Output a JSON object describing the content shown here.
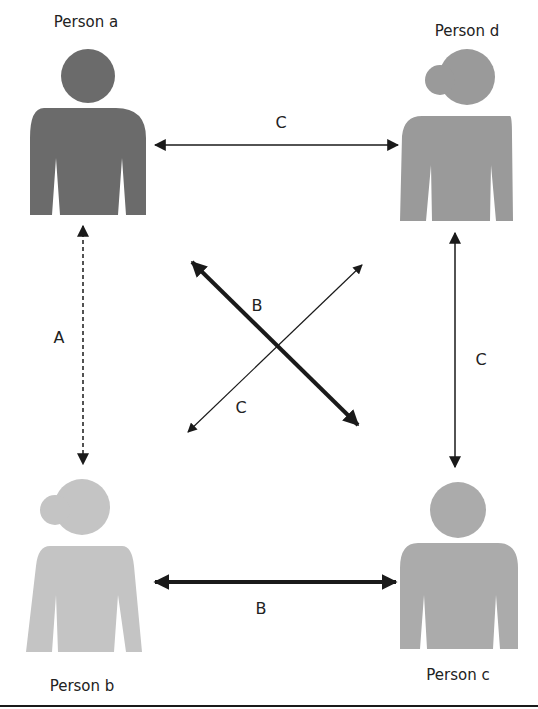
{
  "persons": [
    {
      "id": "a",
      "label": "Person a",
      "figure": "male",
      "color": "#6b6b6b"
    },
    {
      "id": "d",
      "label": "Person d",
      "figure": "female",
      "color": "#9a9a9a"
    },
    {
      "id": "b",
      "label": "Person b",
      "figure": "female",
      "color": "#c4c4c4"
    },
    {
      "id": "c",
      "label": "Person c",
      "figure": "male",
      "color": "#ababab"
    }
  ],
  "edges": [
    {
      "from": "a",
      "to": "d",
      "label": "C",
      "style": "thin"
    },
    {
      "from": "a",
      "to": "b",
      "label": "A",
      "style": "dashed"
    },
    {
      "from": "d",
      "to": "c",
      "label": "C",
      "style": "thin"
    },
    {
      "from": "b",
      "to": "c",
      "label": "B",
      "style": "thick"
    },
    {
      "from": "a",
      "to": "c",
      "label": "B",
      "style": "thick"
    },
    {
      "from": "b",
      "to": "d",
      "label": "C",
      "style": "thin"
    }
  ],
  "colors": {
    "line": "#1a1a1a",
    "text": "#222222",
    "border": "#1a1a1a"
  }
}
